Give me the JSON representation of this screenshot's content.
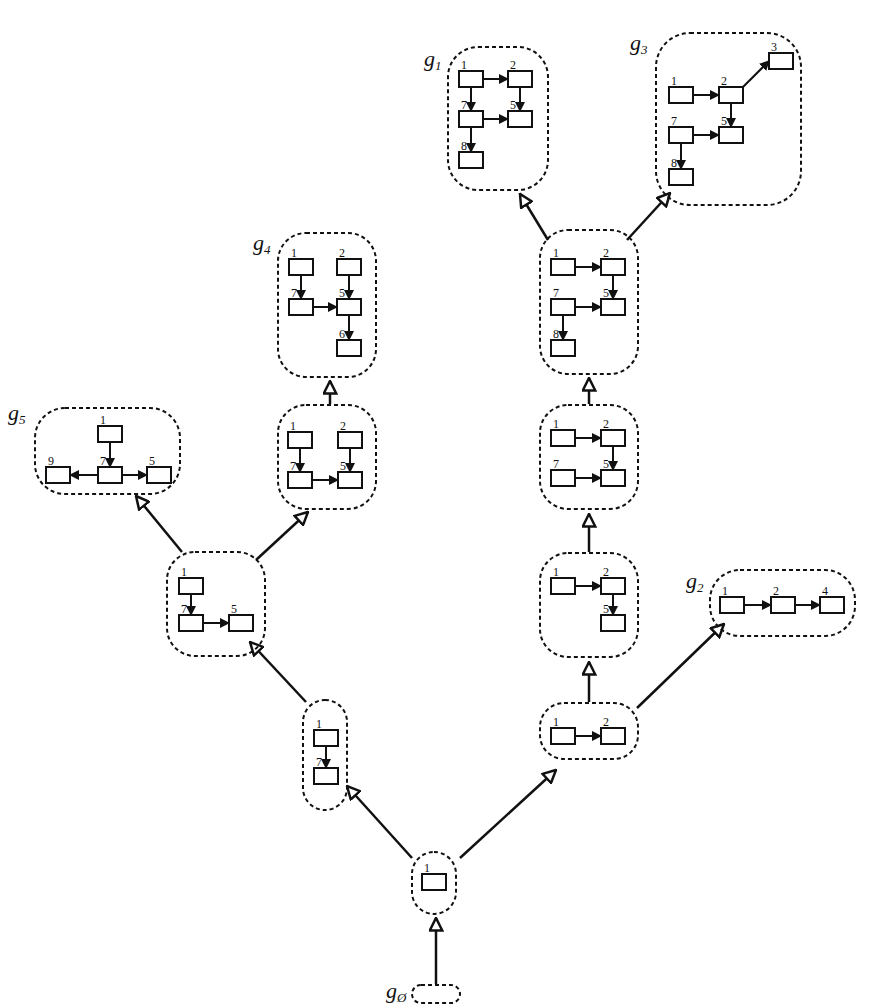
{
  "diagram": {
    "type": "subgraph-lattice",
    "groups": [
      {
        "id": "g_empty",
        "label": "g",
        "sub": "Ø",
        "label_pos": [
          386,
          998
        ],
        "box": [
          412,
          985,
          48,
          18,
          9
        ],
        "nodes": [],
        "edges": []
      },
      {
        "id": "n1",
        "box": [
          412,
          852,
          44,
          62,
          22
        ],
        "nodes": [
          {
            "id": "1",
            "x": 422,
            "y": 874
          }
        ],
        "edges": []
      },
      {
        "id": "n17",
        "box": [
          303,
          700,
          44,
          110,
          22
        ],
        "nodes": [
          {
            "id": "1",
            "x": 314,
            "y": 730
          },
          {
            "id": "7",
            "x": 314,
            "y": 768
          }
        ],
        "edges": [
          [
            "1",
            "7",
            "down"
          ]
        ]
      },
      {
        "id": "n12",
        "box": [
          540,
          703,
          98,
          56,
          24
        ],
        "nodes": [
          {
            "id": "1",
            "x": 551,
            "y": 728
          },
          {
            "id": "2",
            "x": 601,
            "y": 728
          }
        ],
        "edges": [
          [
            "1",
            "2",
            "right"
          ]
        ]
      },
      {
        "id": "n175",
        "box": [
          167,
          552,
          98,
          104,
          28
        ],
        "nodes": [
          {
            "id": "1",
            "x": 179,
            "y": 578
          },
          {
            "id": "7",
            "x": 179,
            "y": 615
          },
          {
            "id": "5",
            "x": 229,
            "y": 615
          }
        ],
        "edges": [
          [
            "1",
            "7",
            "down"
          ],
          [
            "7",
            "5",
            "right"
          ]
        ]
      },
      {
        "id": "n125",
        "box": [
          540,
          553,
          98,
          104,
          28
        ],
        "nodes": [
          {
            "id": "1",
            "x": 551,
            "y": 578
          },
          {
            "id": "2",
            "x": 601,
            "y": 578
          },
          {
            "id": "5",
            "x": 601,
            "y": 615
          }
        ],
        "edges": [
          [
            "1",
            "2",
            "right"
          ],
          [
            "2",
            "5",
            "down"
          ]
        ]
      },
      {
        "id": "g2",
        "label": "g",
        "sub": "2",
        "label_pos": [
          686,
          588
        ],
        "box": [
          710,
          570,
          145,
          66,
          30
        ],
        "nodes": [
          {
            "id": "1",
            "x": 720,
            "y": 597
          },
          {
            "id": "2",
            "x": 771,
            "y": 597
          },
          {
            "id": "4",
            "x": 820,
            "y": 597
          }
        ],
        "edges": [
          [
            "1",
            "2",
            "right"
          ],
          [
            "2",
            "4",
            "right"
          ]
        ]
      },
      {
        "id": "n1275",
        "box": [
          540,
          405,
          98,
          104,
          28
        ],
        "nodes": [
          {
            "id": "1",
            "x": 551,
            "y": 430
          },
          {
            "id": "2",
            "x": 601,
            "y": 430
          },
          {
            "id": "7",
            "x": 551,
            "y": 470
          },
          {
            "id": "5",
            "x": 601,
            "y": 470
          }
        ],
        "edges": [
          [
            "1",
            "2",
            "right"
          ],
          [
            "2",
            "5",
            "down"
          ],
          [
            "7",
            "5",
            "right"
          ]
        ]
      },
      {
        "id": "n1275b",
        "box": [
          278,
          405,
          98,
          104,
          28
        ],
        "nodes": [
          {
            "id": "1",
            "x": 288,
            "y": 432
          },
          {
            "id": "2",
            "x": 338,
            "y": 432
          },
          {
            "id": "7",
            "x": 288,
            "y": 472
          },
          {
            "id": "5",
            "x": 338,
            "y": 472
          }
        ],
        "edges": [
          [
            "1",
            "7",
            "down"
          ],
          [
            "2",
            "5",
            "down"
          ],
          [
            "7",
            "5",
            "right"
          ]
        ]
      },
      {
        "id": "g5",
        "label": "g",
        "sub": "5",
        "label_pos": [
          8,
          420
        ],
        "box": [
          35,
          408,
          145,
          86,
          30
        ],
        "nodes": [
          {
            "id": "1",
            "x": 98,
            "y": 426
          },
          {
            "id": "9",
            "x": 46,
            "y": 467
          },
          {
            "id": "7",
            "x": 98,
            "y": 467
          },
          {
            "id": "5",
            "x": 147,
            "y": 467
          }
        ],
        "edges": [
          [
            "1",
            "7",
            "down"
          ],
          [
            "7",
            "9",
            "left"
          ],
          [
            "7",
            "5",
            "right"
          ]
        ]
      },
      {
        "id": "g4",
        "label": "g",
        "sub": "4",
        "label_pos": [
          253,
          250
        ],
        "box": [
          278,
          233,
          98,
          144,
          28
        ],
        "nodes": [
          {
            "id": "1",
            "x": 289,
            "y": 259
          },
          {
            "id": "2",
            "x": 337,
            "y": 259
          },
          {
            "id": "7",
            "x": 289,
            "y": 299
          },
          {
            "id": "5",
            "x": 337,
            "y": 299
          },
          {
            "id": "6",
            "x": 337,
            "y": 340
          }
        ],
        "edges": [
          [
            "1",
            "7",
            "down"
          ],
          [
            "2",
            "5",
            "down"
          ],
          [
            "7",
            "5",
            "right"
          ],
          [
            "5",
            "6",
            "down"
          ]
        ]
      },
      {
        "id": "n12758",
        "box": [
          540,
          230,
          98,
          144,
          28
        ],
        "nodes": [
          {
            "id": "1",
            "x": 551,
            "y": 259
          },
          {
            "id": "2",
            "x": 601,
            "y": 259
          },
          {
            "id": "7",
            "x": 551,
            "y": 299
          },
          {
            "id": "5",
            "x": 601,
            "y": 299
          },
          {
            "id": "8",
            "x": 551,
            "y": 340
          }
        ],
        "edges": [
          [
            "1",
            "2",
            "right"
          ],
          [
            "2",
            "5",
            "down"
          ],
          [
            "7",
            "5",
            "right"
          ],
          [
            "7",
            "8",
            "down"
          ]
        ]
      },
      {
        "id": "g1",
        "label": "g",
        "sub": "1",
        "label_pos": [
          424,
          66
        ],
        "box": [
          448,
          47,
          100,
          143,
          30
        ],
        "nodes": [
          {
            "id": "1",
            "x": 459,
            "y": 71
          },
          {
            "id": "2",
            "x": 508,
            "y": 71
          },
          {
            "id": "7",
            "x": 459,
            "y": 111
          },
          {
            "id": "5",
            "x": 508,
            "y": 111
          },
          {
            "id": "8",
            "x": 459,
            "y": 152
          }
        ],
        "edges": [
          [
            "1",
            "2",
            "right"
          ],
          [
            "1",
            "7",
            "down"
          ],
          [
            "2",
            "5",
            "down"
          ],
          [
            "7",
            "5",
            "right"
          ],
          [
            "7",
            "8",
            "down"
          ]
        ]
      },
      {
        "id": "g3",
        "label": "g",
        "sub": "3",
        "label_pos": [
          630,
          50
        ],
        "box": [
          656,
          33,
          145,
          172,
          34
        ],
        "nodes": [
          {
            "id": "1",
            "x": 669,
            "y": 87
          },
          {
            "id": "2",
            "x": 719,
            "y": 87
          },
          {
            "id": "3",
            "x": 769,
            "y": 53
          },
          {
            "id": "7",
            "x": 669,
            "y": 127
          },
          {
            "id": "5",
            "x": 719,
            "y": 127
          },
          {
            "id": "8",
            "x": 669,
            "y": 169
          }
        ],
        "edges": [
          [
            "1",
            "2",
            "right"
          ],
          [
            "2",
            "3",
            "diag"
          ],
          [
            "2",
            "5",
            "down"
          ],
          [
            "7",
            "5",
            "right"
          ],
          [
            "7",
            "8",
            "down"
          ]
        ]
      }
    ],
    "lattice_edges": [
      {
        "from": [
          436,
          984
        ],
        "to": [
          436,
          918
        ]
      },
      {
        "from": [
          412,
          858
        ],
        "to": [
          347,
          786
        ]
      },
      {
        "from": [
          460,
          858
        ],
        "to": [
          556,
          770
        ]
      },
      {
        "from": [
          306,
          702
        ],
        "to": [
          250,
          642
        ]
      },
      {
        "from": [
          589,
          702
        ],
        "to": [
          589,
          662
        ]
      },
      {
        "from": [
          637,
          708
        ],
        "to": [
          724,
          624
        ]
      },
      {
        "from": [
          182,
          552
        ],
        "to": [
          136,
          496
        ]
      },
      {
        "from": [
          256,
          560
        ],
        "to": [
          308,
          512
        ]
      },
      {
        "from": [
          589,
          552
        ],
        "to": [
          589,
          514
        ]
      },
      {
        "from": [
          330,
          404
        ],
        "to": [
          330,
          381
        ]
      },
      {
        "from": [
          589,
          404
        ],
        "to": [
          589,
          378
        ]
      },
      {
        "from": [
          548,
          240
        ],
        "to": [
          520,
          194
        ]
      },
      {
        "from": [
          627,
          240
        ],
        "to": [
          670,
          193
        ]
      }
    ]
  }
}
